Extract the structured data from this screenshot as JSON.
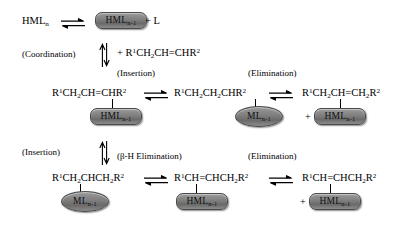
{
  "diagram": {
    "type": "reaction-mechanism"
  },
  "row1": {
    "reactant": "HMLn",
    "product_box": "HMLn-1",
    "plus_ligand": "+ L"
  },
  "step_coordination": {
    "label": "(Coordination)",
    "reagent": "+ R1CH2CH=CHR2"
  },
  "row2": {
    "labels": {
      "insertion": "(Insertion)",
      "elimination": "(Elimination)"
    },
    "species": [
      {
        "formula": "R1CH2CH=CHR2",
        "box": "HMLn-1",
        "box_shape": "capsule",
        "plus": ""
      },
      {
        "formula": "R1CH2CH2CHR2",
        "box": "MLn-1",
        "box_shape": "ellipse",
        "plus": ""
      },
      {
        "formula": "R1CH2CH=CH2R2",
        "box": "HMLn-1",
        "box_shape": "capsule",
        "plus": "+"
      }
    ]
  },
  "step_insertion": {
    "label": "(Insertion)"
  },
  "row3": {
    "labels": {
      "beta_h_elimination": "(β-H Elimination)",
      "elimination": "(Elimination)"
    },
    "species": [
      {
        "formula": "R1CH2CHCH2R2",
        "box": "MLn-1",
        "box_shape": "ellipse",
        "plus": ""
      },
      {
        "formula": "R1CH=CHCH2R2",
        "box": "HMLn-1",
        "box_shape": "capsule",
        "plus": ""
      },
      {
        "formula": "R1CH=CHCH2R2",
        "box": "HMLn-1",
        "box_shape": "capsule",
        "plus": "+"
      }
    ]
  },
  "symbols": {
    "equilibrium_arrow": "⇌",
    "plus": "+"
  },
  "colors": {
    "background": "#ffffff",
    "text": "#000000",
    "capsule_fill": "#7e7e7e",
    "capsule_border": "#4a4a4a"
  }
}
